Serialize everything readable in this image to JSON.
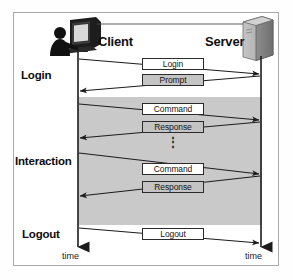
{
  "figure": {
    "type": "sequence-diagram",
    "actors": [
      {
        "id": "client",
        "label": "Client",
        "icon": "workstation-user-icon"
      },
      {
        "id": "server",
        "label": "Server",
        "icon": "server-tower-icon"
      }
    ],
    "phases": [
      {
        "id": "login",
        "label": "Login"
      },
      {
        "id": "interaction",
        "label": "Interaction"
      },
      {
        "id": "logout",
        "label": "Logout"
      }
    ],
    "messages": [
      {
        "id": "m1",
        "label": "Login",
        "direction": "client-to-server",
        "fill": "white"
      },
      {
        "id": "m2",
        "label": "Prompt",
        "direction": "server-to-client",
        "fill": "gray"
      },
      {
        "id": "m3",
        "label": "Command",
        "direction": "client-to-server",
        "fill": "white"
      },
      {
        "id": "m4",
        "label": "Response",
        "direction": "server-to-client",
        "fill": "gray"
      },
      {
        "id": "m5",
        "label": "Command",
        "direction": "client-to-server",
        "fill": "white"
      },
      {
        "id": "m6",
        "label": "Response",
        "direction": "server-to-client",
        "fill": "gray"
      },
      {
        "id": "m7",
        "label": "Logout",
        "direction": "client-to-server",
        "fill": "white"
      }
    ],
    "continuation_mark": "⋮",
    "axis": {
      "client_time_label": "time",
      "server_time_label": "time"
    },
    "colors": {
      "band_gray": "#c9c9c9",
      "box_gray": "#c4c4c4",
      "box_white": "#ffffff",
      "line": "#2b2b2b",
      "frame": "#a9a9a9",
      "text": "#101010"
    }
  }
}
